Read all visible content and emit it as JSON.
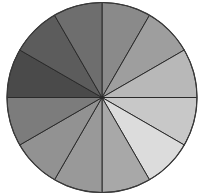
{
  "chart_data": {
    "type": "pie",
    "title": "",
    "legend": [],
    "start_angle_deg": 0,
    "direction": "clockwise",
    "center": [
      102,
      97.5
    ],
    "radius": 95,
    "slice_stroke": "#2a2a2a",
    "outline_stroke": "#3a3a3a",
    "categories": [
      "",
      "",
      "",
      "",
      "",
      "",
      "",
      "",
      "",
      "",
      "",
      ""
    ],
    "values": [
      1,
      1,
      1,
      1,
      1,
      1,
      1,
      1,
      1,
      1,
      1,
      1
    ],
    "colors": [
      "#8a8a8a",
      "#9e9e9e",
      "#b8b8b8",
      "#c8c8c8",
      "#dcdcdc",
      "#a8a8a8",
      "#999999",
      "#929292",
      "#7c7c7c",
      "#4a4a4a",
      "#5c5c5c",
      "#6e6e6e"
    ]
  }
}
